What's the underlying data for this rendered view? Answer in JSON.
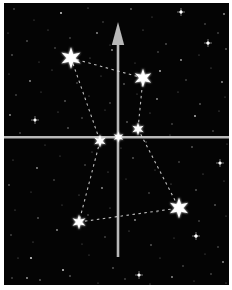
{
  "figure": {
    "width": 232,
    "height": 290,
    "frame": {
      "color": "#ffffff",
      "left": 4,
      "top": 3,
      "right": 3,
      "bottom": 5
    },
    "sky_color": "#040404"
  },
  "axes": {
    "color": "#b9b9b9",
    "vertical": {
      "x": 118,
      "top": 44,
      "bottom": 257,
      "width": 2.6,
      "arrow": {
        "tip_y": 22,
        "base_y": 45,
        "half_width": 6.2
      }
    },
    "horizontal": {
      "y": 137.2,
      "left": 4,
      "right": 229,
      "width": 2.4
    }
  },
  "constellation": {
    "star_color": "#ffffff",
    "line": {
      "color": "#e0e0e0",
      "width": 1.1,
      "dash": "2.5 3.5",
      "opacity": 0.85
    },
    "stars": [
      {
        "id": "A",
        "x": 71,
        "y": 58,
        "r": 11
      },
      {
        "id": "B",
        "x": 143,
        "y": 78,
        "r": 9.5
      },
      {
        "id": "C",
        "x": 138,
        "y": 129,
        "r": 6.5
      },
      {
        "id": "D",
        "x": 118.5,
        "y": 137,
        "r": 5.5
      },
      {
        "id": "E",
        "x": 100,
        "y": 141,
        "r": 6.5
      },
      {
        "id": "F",
        "x": 79,
        "y": 222,
        "r": 7.5
      },
      {
        "id": "G",
        "x": 179,
        "y": 208,
        "r": 10.5
      }
    ],
    "connections": [
      [
        "A",
        "B"
      ],
      [
        "B",
        "C"
      ],
      [
        "A",
        "E"
      ],
      [
        "E",
        "F"
      ],
      [
        "F",
        "G"
      ],
      [
        "C",
        "G"
      ]
    ]
  },
  "starfield": {
    "dot_color": "#ffffff",
    "dots": [
      [
        14,
        9,
        0.7,
        0.5
      ],
      [
        34,
        20,
        0.6,
        0.4
      ],
      [
        61,
        13,
        1,
        0.8
      ],
      [
        88,
        8,
        0.6,
        0.5
      ],
      [
        103,
        22,
        0.7,
        0.4
      ],
      [
        131,
        9,
        0.8,
        0.6
      ],
      [
        152,
        17,
        0.6,
        0.4
      ],
      [
        181,
        12,
        1.4,
        0.95
      ],
      [
        205,
        24,
        0.7,
        0.5
      ],
      [
        224,
        14,
        0.9,
        0.6
      ],
      [
        8,
        33,
        0.6,
        0.4
      ],
      [
        27,
        41,
        0.8,
        0.5
      ],
      [
        48,
        30,
        0.6,
        0.45
      ],
      [
        70,
        38,
        0.7,
        0.5
      ],
      [
        97,
        33,
        0.9,
        0.6
      ],
      [
        110,
        45,
        0.6,
        0.4
      ],
      [
        143,
        30,
        0.6,
        0.5
      ],
      [
        166,
        44,
        0.8,
        0.5
      ],
      [
        208,
        43,
        1.5,
        0.95
      ],
      [
        218,
        33,
        0.7,
        0.5
      ],
      [
        12,
        55,
        0.8,
        0.5
      ],
      [
        39,
        62,
        0.6,
        0.4
      ],
      [
        55,
        48,
        0.7,
        0.5
      ],
      [
        90,
        58,
        0.6,
        0.45
      ],
      [
        112,
        50,
        0.9,
        0.6
      ],
      [
        135,
        63,
        0.6,
        0.4
      ],
      [
        158,
        52,
        0.7,
        0.5
      ],
      [
        181,
        60,
        0.9,
        0.65
      ],
      [
        199,
        55,
        0.6,
        0.45
      ],
      [
        226,
        49,
        0.8,
        0.55
      ],
      [
        9,
        74,
        0.6,
        0.4
      ],
      [
        30,
        81,
        0.9,
        0.6
      ],
      [
        52,
        70,
        0.6,
        0.45
      ],
      [
        77,
        83,
        0.7,
        0.5
      ],
      [
        101,
        76,
        0.6,
        0.4
      ],
      [
        124,
        84,
        0.8,
        0.55
      ],
      [
        160,
        71,
        1,
        0.7
      ],
      [
        186,
        80,
        0.7,
        0.5
      ],
      [
        211,
        68,
        0.6,
        0.45
      ],
      [
        222,
        82,
        0.9,
        0.6
      ],
      [
        16,
        95,
        0.7,
        0.5
      ],
      [
        41,
        92,
        0.6,
        0.4
      ],
      [
        65,
        101,
        0.8,
        0.55
      ],
      [
        89,
        96,
        0.6,
        0.45
      ],
      [
        110,
        103,
        0.7,
        0.5
      ],
      [
        137,
        94,
        0.6,
        0.4
      ],
      [
        157,
        99,
        0.9,
        0.6
      ],
      [
        178,
        92,
        0.6,
        0.45
      ],
      [
        200,
        104,
        0.8,
        0.55
      ],
      [
        225,
        97,
        0.6,
        0.4
      ],
      [
        10,
        115,
        0.9,
        0.6
      ],
      [
        35,
        120,
        1.2,
        0.8
      ],
      [
        58,
        112,
        0.6,
        0.45
      ],
      [
        82,
        118,
        0.7,
        0.5
      ],
      [
        105,
        110,
        0.6,
        0.4
      ],
      [
        127,
        122,
        0.8,
        0.55
      ],
      [
        150,
        113,
        0.6,
        0.45
      ],
      [
        172,
        124,
        0.7,
        0.5
      ],
      [
        195,
        116,
        1,
        0.7
      ],
      [
        219,
        111,
        0.6,
        0.45
      ],
      [
        20,
        133,
        0.7,
        0.5
      ],
      [
        45,
        145,
        0.6,
        0.4
      ],
      [
        68,
        128,
        0.8,
        0.55
      ],
      [
        92,
        152,
        0.6,
        0.45
      ],
      [
        121,
        148,
        0.6,
        0.4
      ],
      [
        146,
        142,
        0.7,
        0.5
      ],
      [
        170,
        135,
        0.6,
        0.45
      ],
      [
        192,
        147,
        0.8,
        0.55
      ],
      [
        213,
        131,
        0.7,
        0.5
      ],
      [
        227,
        144,
        0.6,
        0.4
      ],
      [
        13,
        160,
        0.6,
        0.45
      ],
      [
        37,
        168,
        0.9,
        0.6
      ],
      [
        60,
        156,
        0.6,
        0.4
      ],
      [
        85,
        165,
        0.7,
        0.5
      ],
      [
        108,
        172,
        0.6,
        0.45
      ],
      [
        133,
        158,
        0.8,
        0.55
      ],
      [
        155,
        170,
        0.6,
        0.4
      ],
      [
        179,
        162,
        0.7,
        0.5
      ],
      [
        220,
        163,
        1.3,
        0.9
      ],
      [
        203,
        174,
        0.6,
        0.45
      ],
      [
        9,
        185,
        0.8,
        0.55
      ],
      [
        31,
        192,
        0.6,
        0.4
      ],
      [
        54,
        180,
        0.7,
        0.5
      ],
      [
        79,
        195,
        0.6,
        0.45
      ],
      [
        102,
        188,
        0.9,
        0.6
      ],
      [
        126,
        179,
        0.6,
        0.4
      ],
      [
        149,
        193,
        0.7,
        0.5
      ],
      [
        171,
        184,
        0.6,
        0.45
      ],
      [
        196,
        190,
        0.8,
        0.55
      ],
      [
        224,
        181,
        0.6,
        0.4
      ],
      [
        15,
        210,
        0.6,
        0.45
      ],
      [
        38,
        218,
        0.8,
        0.55
      ],
      [
        62,
        205,
        0.6,
        0.4
      ],
      [
        88,
        215,
        0.7,
        0.5
      ],
      [
        110,
        208,
        0.6,
        0.45
      ],
      [
        135,
        220,
        0.9,
        0.6
      ],
      [
        157,
        212,
        0.6,
        0.4
      ],
      [
        199,
        221,
        0.7,
        0.5
      ],
      [
        215,
        205,
        0.8,
        0.55
      ],
      [
        226,
        216,
        0.6,
        0.4
      ],
      [
        11,
        235,
        0.7,
        0.5
      ],
      [
        33,
        242,
        0.6,
        0.45
      ],
      [
        57,
        230,
        0.9,
        0.6
      ],
      [
        82,
        244,
        0.6,
        0.4
      ],
      [
        105,
        237,
        0.7,
        0.5
      ],
      [
        129,
        231,
        0.6,
        0.45
      ],
      [
        151,
        245,
        0.8,
        0.55
      ],
      [
        174,
        238,
        0.6,
        0.4
      ],
      [
        196,
        236,
        1.6,
        1
      ],
      [
        218,
        247,
        0.7,
        0.5
      ],
      [
        18,
        258,
        0.6,
        0.45
      ],
      [
        31,
        258,
        1.1,
        0.8
      ],
      [
        63,
        270,
        1,
        0.8
      ],
      [
        89,
        255,
        0.6,
        0.4
      ],
      [
        113,
        268,
        0.8,
        0.55
      ],
      [
        139,
        275,
        1.3,
        0.9
      ],
      [
        160,
        258,
        0.6,
        0.45
      ],
      [
        183,
        266,
        0.7,
        0.5
      ],
      [
        205,
        254,
        0.6,
        0.4
      ],
      [
        223,
        262,
        0.9,
        0.6
      ],
      [
        12,
        278,
        0.7,
        0.5
      ],
      [
        27,
        278,
        0.9,
        0.65
      ],
      [
        40,
        280,
        0.8,
        0.6
      ],
      [
        70,
        276,
        0.8,
        0.55
      ],
      [
        98,
        283,
        0.6,
        0.4
      ],
      [
        125,
        279,
        0.7,
        0.5
      ],
      [
        150,
        284,
        0.6,
        0.45
      ],
      [
        172,
        277,
        0.9,
        0.6
      ],
      [
        194,
        281,
        0.6,
        0.4
      ],
      [
        211,
        274,
        0.7,
        0.5
      ],
      [
        226,
        283,
        0.6,
        0.45
      ]
    ],
    "sparkles": [
      [
        181,
        12
      ],
      [
        208,
        43
      ],
      [
        220,
        163
      ],
      [
        196,
        236
      ],
      [
        139,
        275
      ],
      [
        35,
        120
      ]
    ]
  }
}
